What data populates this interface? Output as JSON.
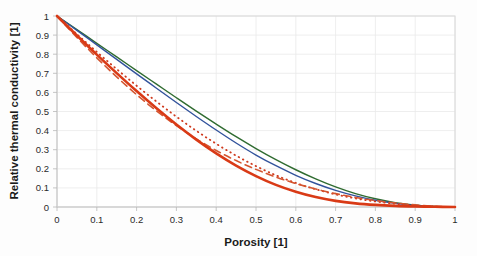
{
  "figure": {
    "background_color": "#fdfdfd",
    "frame_color": "#d8d8d8",
    "grid_color": "#eaeaea"
  },
  "chart_data": {
    "type": "line",
    "title": "",
    "subtitle": "",
    "xlabel": "Porosity [1]",
    "ylabel": "Relative thermal conductivity [1]",
    "xlim": [
      0,
      1
    ],
    "ylim": [
      0,
      1
    ],
    "grid": true,
    "legend": "none",
    "legend_position": "none",
    "xticks": [
      "0",
      "0.1",
      "0.2",
      "0.3",
      "0.4",
      "0.5",
      "0.6",
      "0.7",
      "0.8",
      "0.9",
      "1"
    ],
    "yticks": [
      "0",
      "0.1",
      "0.2",
      "0.3",
      "0.4",
      "0.5",
      "0.6",
      "0.7",
      "0.8",
      "0.9",
      "1"
    ],
    "xtick_values": [
      0,
      0.1,
      0.2,
      0.3,
      0.4,
      0.5,
      0.6,
      0.7,
      0.8,
      0.9,
      1
    ],
    "ytick_values": [
      0,
      0.1,
      0.2,
      0.3,
      0.4,
      0.5,
      0.6,
      0.7,
      0.8,
      0.9,
      1
    ],
    "x": [
      0,
      0.05,
      0.1,
      0.15,
      0.2,
      0.25,
      0.3,
      0.35,
      0.4,
      0.45,
      0.5,
      0.55,
      0.6,
      0.65,
      0.7,
      0.75,
      0.8,
      0.85,
      0.9,
      0.95,
      1
    ],
    "series": [
      {
        "name": "green-solid",
        "color": "#2f6b30",
        "style": "solid",
        "width": 1.4,
        "values": [
          1,
          0.929,
          0.857,
          0.786,
          0.714,
          0.643,
          0.572,
          0.502,
          0.434,
          0.368,
          0.306,
          0.248,
          0.195,
          0.147,
          0.105,
          0.07,
          0.043,
          0.023,
          0.01,
          0.003,
          0
        ]
      },
      {
        "name": "blue-solid",
        "color": "#32539c",
        "style": "solid",
        "width": 1.4,
        "values": [
          1,
          0.925,
          0.849,
          0.773,
          0.697,
          0.622,
          0.547,
          0.474,
          0.403,
          0.335,
          0.272,
          0.216,
          0.166,
          0.123,
          0.087,
          0.058,
          0.035,
          0.019,
          0.008,
          0.002,
          0
        ]
      },
      {
        "name": "red-dotted",
        "color": "#cf3a1e",
        "style": "dotted",
        "width": 1.8,
        "values": [
          1,
          0.905,
          0.812,
          0.722,
          0.635,
          0.552,
          0.473,
          0.399,
          0.331,
          0.269,
          0.214,
          0.166,
          0.126,
          0.093,
          0.066,
          0.045,
          0.029,
          0.017,
          0.008,
          0.002,
          0
        ]
      },
      {
        "name": "red-dashed",
        "color": "#d4552f",
        "style": "dashed",
        "width": 1.6,
        "values": [
          1,
          0.888,
          0.781,
          0.681,
          0.588,
          0.503,
          0.426,
          0.357,
          0.296,
          0.243,
          0.197,
          0.157,
          0.123,
          0.094,
          0.07,
          0.05,
          0.034,
          0.021,
          0.011,
          0.004,
          0
        ]
      },
      {
        "name": "red-solid-thick",
        "color": "#d93a16",
        "style": "solid",
        "width": 2.6,
        "values": [
          1,
          0.898,
          0.798,
          0.701,
          0.607,
          0.517,
          0.432,
          0.353,
          0.281,
          0.217,
          0.162,
          0.116,
          0.08,
          0.052,
          0.032,
          0.019,
          0.011,
          0.006,
          0.003,
          0.001,
          0
        ]
      }
    ]
  }
}
